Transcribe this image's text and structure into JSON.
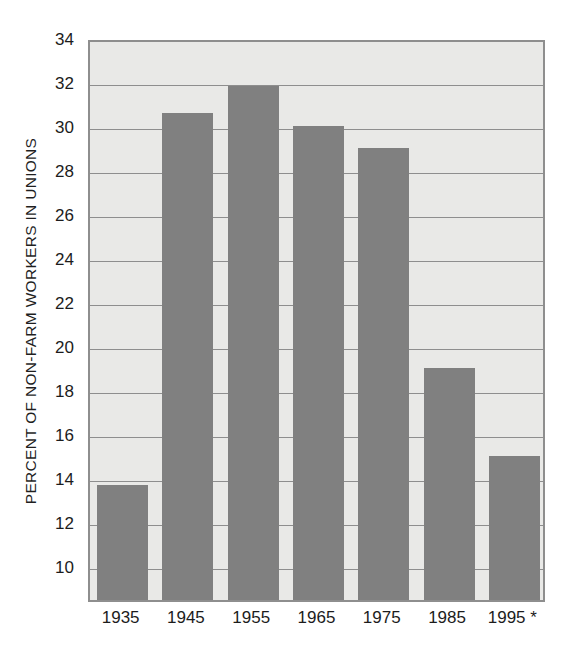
{
  "chart_data": {
    "type": "bar",
    "title": "",
    "xlabel": "",
    "ylabel": "PERCENT OF NON-FARM WORKERS IN UNIONS",
    "categories": [
      "1935",
      "1945",
      "1955",
      "1965",
      "1975",
      "1985",
      "1995 *"
    ],
    "values": [
      13.7,
      30.6,
      31.8,
      30.0,
      29.0,
      19.0,
      15.0
    ],
    "ylim": [
      8.45,
      34
    ],
    "y_ticks": [
      34,
      32,
      30,
      28,
      26,
      24,
      22,
      20,
      18,
      16,
      14,
      12,
      10
    ],
    "y_tick_labels": [
      "34",
      "32",
      "30",
      "28",
      "26",
      "24",
      "22",
      "20",
      "18",
      "16",
      "14",
      "12",
      "10"
    ],
    "grid": true,
    "legend": false,
    "footnote_marker": "*",
    "colors": {
      "bar": "#808080",
      "plot_background": "#e9e9e7",
      "axis": "#8e8e8e",
      "text": "#1c1c1c",
      "page_background": "#ffffff"
    }
  }
}
